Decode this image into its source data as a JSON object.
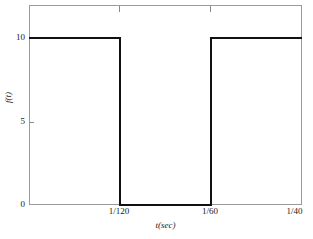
{
  "chart_data": {
    "type": "line",
    "title": "",
    "xlabel": "t(sec)",
    "ylabel": "f(t)",
    "xlabel_plain": "t(sec)",
    "ylabel_plain": "f(t)",
    "xlim": [
      0,
      0.025
    ],
    "ylim": [
      0,
      11.5
    ],
    "grid": false,
    "legend": null,
    "series": [
      {
        "name": "f(t)",
        "waveform": "square",
        "x": [
          0,
          0.008333,
          0.008333,
          0.016667,
          0.016667,
          0.025
        ],
        "y": [
          10,
          10,
          0,
          0,
          10,
          10
        ],
        "color": "#111111",
        "linewidth": 2
      }
    ],
    "xticks": [
      {
        "value": 0.008333,
        "label": "1/120"
      },
      {
        "value": 0.016667,
        "label": "1/60"
      },
      {
        "value": 0.025,
        "label": "1/40"
      }
    ],
    "yticks": [
      {
        "value": 0,
        "label": "0"
      },
      {
        "value": 5,
        "label": "5"
      },
      {
        "value": 10,
        "label": "10"
      }
    ],
    "annotations": [
      "Square wave amplitude 10, high on [0, 1/120), low on [1/120, 1/60), high on [1/60, 1/40]"
    ]
  },
  "axes": {
    "frame_color": "#9a9a9a",
    "tick_color": "#8a8a8a",
    "text_color": "#1a1a1a"
  }
}
